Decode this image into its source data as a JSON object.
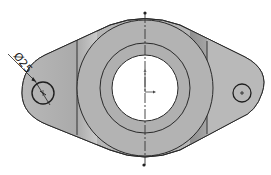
{
  "drawing": {
    "title": "Flange plate top view",
    "dimension": {
      "symbol": "Ø",
      "value": "25",
      "label": "Ø25",
      "target": "left-lug-hole"
    },
    "colors": {
      "background": "#ffffff",
      "body_fill": "#b4b4b4",
      "shadow_fill": "#9a9a9a",
      "highlight_fill": "#c8c8c8",
      "outline": "#2a2a2a",
      "bore_fill": "#ffffff",
      "centerline": "#333333"
    },
    "features": {
      "boss_outer_radius": 68,
      "boss_ring_radius": 45,
      "bore_radius": 33,
      "left_hole": {
        "cx": 43,
        "cy": 93,
        "r": 11
      },
      "right_hole": {
        "cx": 242,
        "cy": 93,
        "r": 9
      },
      "center": {
        "cx": 145,
        "cy": 88
      }
    }
  }
}
